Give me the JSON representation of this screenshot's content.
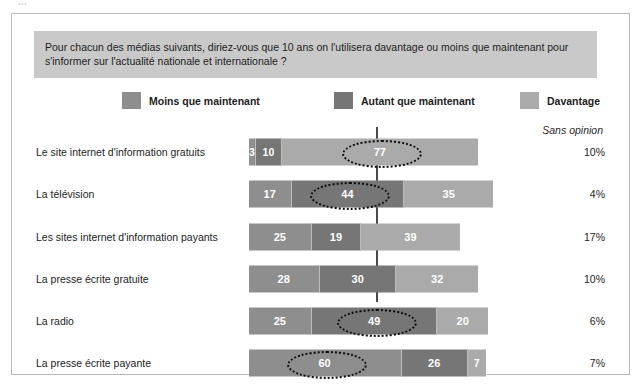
{
  "top_clipped_caption": "...",
  "question": "Pour chacun des médias suivants, diriez-vous que 10 ans on l'utilisera davantage ou moins que maintenant pour s'informer sur l'actualité nationale et internationale ?",
  "legend": [
    {
      "label": "Moins que maintenant",
      "color": "#8e8e8e"
    },
    {
      "label": "Autant que maintenant",
      "color": "#767676"
    },
    {
      "label": "Davantage",
      "color": "#aaaaaa"
    }
  ],
  "sans_opinion_header": "Sans opinion",
  "chart_data": {
    "type": "bar",
    "subtype": "stacked-horizontal",
    "title": "Pour chacun des médias suivants, diriez-vous que 10 ans on l'utilisera davantage ou moins que maintenant pour s'informer sur l'actualité nationale et internationale ?",
    "xlabel": "",
    "ylabel": "",
    "grid": false,
    "legend_position": "top",
    "units": "%",
    "reference_line": 50,
    "categories": [
      "Le site internet d'information gratuits",
      "La télévision",
      "Les sites internet d'information payants",
      "La presse écrite gratuite",
      "La radio",
      "La presse écrite payante"
    ],
    "series": [
      {
        "name": "Moins que maintenant",
        "color": "#8e8e8e",
        "values": [
          3,
          17,
          25,
          28,
          25,
          60
        ]
      },
      {
        "name": "Autant que maintenant",
        "color": "#767676",
        "values": [
          10,
          44,
          19,
          30,
          49,
          26
        ]
      },
      {
        "name": "Davantage",
        "color": "#aaaaaa",
        "values": [
          77,
          35,
          39,
          32,
          20,
          7
        ]
      }
    ],
    "sans_opinion": [
      "10%",
      "4%",
      "17%",
      "10%",
      "6%",
      "7%"
    ],
    "highlighted": [
      {
        "row": 0,
        "series": "Davantage",
        "value": 77
      },
      {
        "row": 1,
        "series": "Autant que maintenant",
        "value": 44
      },
      {
        "row": 4,
        "series": "Autant que maintenant",
        "value": 49
      },
      {
        "row": 5,
        "series": "Moins que maintenant",
        "value": 60
      }
    ]
  },
  "rows": [
    {
      "label": "Le site internet d'information gratuits",
      "moins": 3,
      "autant": 10,
      "davantage": 77,
      "sans_opinion": "10%",
      "highlight": "davantage"
    },
    {
      "label": "La télévision",
      "moins": 17,
      "autant": 44,
      "davantage": 35,
      "sans_opinion": "4%",
      "highlight": "autant"
    },
    {
      "label": "Les sites internet d'information payants",
      "moins": 25,
      "autant": 19,
      "davantage": 39,
      "sans_opinion": "17%",
      "highlight": "none"
    },
    {
      "label": "La presse écrite gratuite",
      "moins": 28,
      "autant": 30,
      "davantage": 32,
      "sans_opinion": "10%",
      "highlight": "none"
    },
    {
      "label": "La radio",
      "moins": 25,
      "autant": 49,
      "davantage": 20,
      "sans_opinion": "6%",
      "highlight": "autant"
    },
    {
      "label": "La presse écrite payante",
      "moins": 60,
      "autant": 26,
      "davantage": 7,
      "sans_opinion": "7%",
      "highlight": "moins"
    }
  ]
}
